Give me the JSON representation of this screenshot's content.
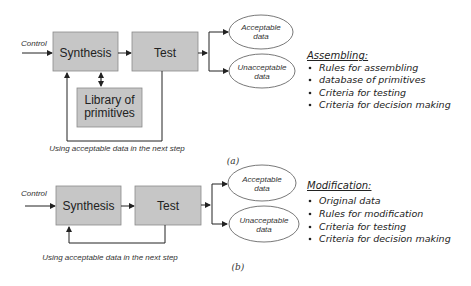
{
  "diagram_a": {
    "control_label": "Control",
    "synthesis_label": "Synthesis",
    "test_label": "Test",
    "library_label_line1": "Library of",
    "library_label_line2": "primitives",
    "acceptable_line1": "Acceptable",
    "acceptable_line2": "data",
    "unacceptable_line1": "Unacceptable",
    "unacceptable_line2": "data",
    "feedback_caption": "Using acceptable data in the next step",
    "sub_label": "(a)",
    "list_title": "Assembling:",
    "list_items": [
      "Rules for assembling",
      "database of primitives",
      "Criteria for testing",
      "Criteria for decision making"
    ]
  },
  "diagram_b": {
    "control_label": "Control",
    "synthesis_label": "Synthesis",
    "test_label": "Test",
    "acceptable_line1": "Acceptable",
    "acceptable_line2": "data",
    "unacceptable_line1": "Unacceptable",
    "unacceptable_line2": "data",
    "feedback_caption": "Using acceptable data in the next step",
    "sub_label": "(b)",
    "list_title": "Modification:",
    "list_items": [
      "Original data",
      "Rules for modification",
      "Criteria for testing",
      "Criteria for decision making"
    ]
  },
  "colors": {
    "box_fill": "#c6c6c6",
    "box_stroke": "#8a8a8a",
    "line": "#222222",
    "ellipse_stroke": "#555555"
  }
}
